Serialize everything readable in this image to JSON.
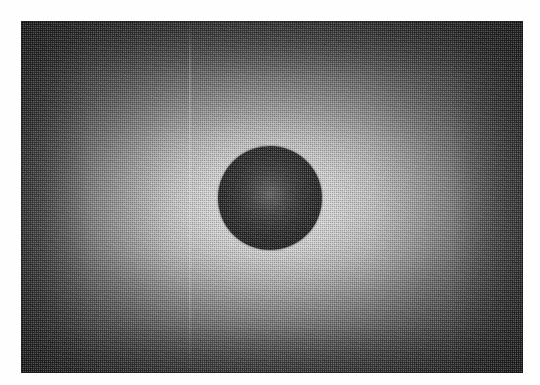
{
  "page": {
    "background_color": "#fefefe",
    "width": 540,
    "height": 385
  },
  "plate": {
    "description": "Grayscale halftone-printed photographic plate showing a dark circular disk centered in a radially illuminated field",
    "x": 21,
    "y": 21,
    "width": 502,
    "height": 352,
    "border_color": "#191919",
    "corner_tone": "#3a3a3a",
    "peak_tone": "#e2e2e2"
  },
  "disk": {
    "label": "central dark disk",
    "center_x": 249,
    "center_y": 177,
    "radius": 52,
    "edge_tone": "#1e1e1e",
    "core_tone": "#656565"
  },
  "artifacts": {
    "halftone_pitch_px": 2,
    "scan_streak_x": 168,
    "scan_streak_tone": "#ffffff"
  },
  "chart_data": {
    "type": "heatmap",
    "title": "",
    "xlabel": "",
    "ylabel": "",
    "colormap": "grayscale",
    "grid": false,
    "legend": "none",
    "xlim": [
      0,
      502
    ],
    "ylim": [
      0,
      352
    ],
    "radial_profile": {
      "radius_px": [
        0,
        52,
        70,
        100,
        140,
        180,
        230,
        290
      ],
      "intensity": [
        85,
        30,
        216,
        205,
        170,
        128,
        85,
        58
      ],
      "note": "intensity in 0-255 grayscale; r<52 is the dark disk, peak brightness just outside the disk rim"
    },
    "features": [
      {
        "name": "dark disk",
        "center": [
          249,
          177
        ],
        "radius": 52,
        "mean_intensity": 38
      },
      {
        "name": "bright halo",
        "center": [
          249,
          183
        ],
        "radius": 95,
        "mean_intensity": 205
      },
      {
        "name": "dark corners",
        "center": null,
        "radius": null,
        "mean_intensity": 58
      }
    ]
  }
}
